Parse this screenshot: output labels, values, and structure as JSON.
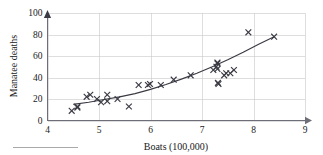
{
  "chart_data": {
    "type": "scatter",
    "title": "",
    "xlabel": "Boats (100,000)",
    "ylabel": "Manatee deaths",
    "xlim": [
      4,
      9
    ],
    "ylim": [
      0,
      100
    ],
    "xticks": [
      4,
      5,
      6,
      7,
      8,
      9
    ],
    "yticks": [
      0,
      20,
      40,
      60,
      80,
      100
    ],
    "grid": true,
    "legend": "none",
    "marker": "x",
    "points": [
      {
        "x": 4.47,
        "y": 13
      },
      {
        "x": 4.58,
        "y": 21
      },
      {
        "x": 4.58,
        "y": 24
      },
      {
        "x": 4.76,
        "y": 16
      },
      {
        "x": 4.83,
        "y": 24
      },
      {
        "x": 4.96,
        "y": 20
      },
      {
        "x": 5.04,
        "y": 15
      },
      {
        "x": 5.1,
        "y": 34
      },
      {
        "x": 5.16,
        "y": 33
      },
      {
        "x": 5.26,
        "y": 33
      },
      {
        "x": 5.46,
        "y": 39
      },
      {
        "x": 5.56,
        "y": 43
      },
      {
        "x": 5.59,
        "y": 50
      },
      {
        "x": 5.68,
        "y": 47
      },
      {
        "x": 6.0,
        "y": 53
      },
      {
        "x": 6.1,
        "y": 38
      },
      {
        "x": 6.2,
        "y": 35
      },
      {
        "x": 6.4,
        "y": 49
      },
      {
        "x": 6.78,
        "y": 42
      },
      {
        "x": 7.21,
        "y": 60
      },
      {
        "x": 7.27,
        "y": 54
      },
      {
        "x": 7.3,
        "y": 67
      },
      {
        "x": 7.32,
        "y": 82
      },
      {
        "x": 7.35,
        "y": 78
      },
      {
        "x": 7.43,
        "y": 81
      },
      {
        "x": 7.5,
        "y": 95
      }
    ],
    "series": [
      {
        "name": "observations",
        "x": [
          4.47,
          4.58,
          4.58,
          4.76,
          4.83,
          4.96,
          5.04,
          5.16,
          5.16,
          5.36,
          5.58,
          5.77,
          5.95,
          5.99,
          6.2,
          6.45,
          6.78,
          7.22,
          7.28,
          7.3,
          7.3,
          7.3,
          7.31,
          7.32,
          7.43,
          7.47,
          7.55,
          7.62,
          7.9,
          8.4
        ],
        "y": [
          9,
          12,
          13,
          22,
          24,
          20,
          17,
          24,
          18,
          20,
          13,
          33,
          33,
          34,
          33,
          38,
          42,
          47,
          50,
          48,
          53,
          54,
          35,
          34,
          42,
          44,
          44,
          47,
          82,
          78
        ]
      }
    ],
    "fit_curve": {
      "name": "exponential fit",
      "x": [
        4.5,
        4.8,
        5.1,
        5.4,
        5.7,
        6.0,
        6.3,
        6.6,
        6.9,
        7.2,
        7.5,
        7.8,
        8.1,
        8.4
      ],
      "y": [
        15,
        17,
        19.5,
        22,
        25,
        29,
        33.5,
        38.5,
        44,
        50,
        56.5,
        63.5,
        71,
        78
      ]
    }
  },
  "axes": {
    "y_title": "Manatee deaths",
    "x_title": "Boats (100,000)",
    "x_tick_labels": [
      "4",
      "5",
      "6",
      "7",
      "8",
      "9"
    ],
    "y_tick_labels": [
      "0",
      "20",
      "40",
      "60",
      "80",
      "100"
    ]
  },
  "colors": {
    "marker": "#3a3a44",
    "curve": "#3a3a44",
    "grid": "#c8c8c8",
    "axis": "#6e6e78",
    "background": "#ffffff"
  }
}
